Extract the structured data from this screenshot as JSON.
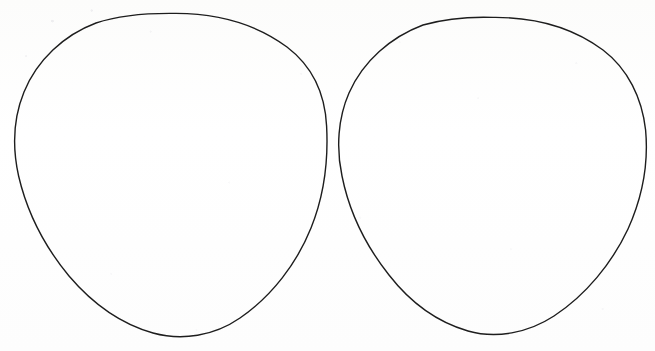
{
  "canvas": {
    "width": 655,
    "height": 351,
    "background_color": "#fdfdfc",
    "paper_tone": "#ffffff",
    "description": "Scanned sheet of paper with two hand-drawn circle outlines side by side"
  },
  "ink": {
    "stroke_color": "#1d1d1d",
    "stroke_width": 1.4,
    "style": "hand-drawn pen outline"
  },
  "shapes": [
    {
      "id": "left-circle",
      "label": "Left circle",
      "type": "circle-outline",
      "center_x": 170,
      "center_y": 175,
      "radius_x": 156,
      "radius_y": 162,
      "bounds": {
        "left": 14,
        "top": 13,
        "right": 327,
        "bottom": 338
      },
      "filled": false,
      "path": "M 176 13.4 C 217 13.6 256 24 287 47 C 312 66 325 94 326.6 126 C 328.4 160 324 196 311 228 C 297 263 272 296 240 318 C 214 336 182 341 153 333 C 121 324 92 303 69 276 C 45 247 27 212 18.6 176 C 12.4 148 13.4 118 24 92 C 37 60 64 35 96 23 C 121 14.6 149 13 176 13.4 Z"
    },
    {
      "id": "right-circle",
      "label": "Right circle",
      "type": "circle-outline",
      "center_x": 494,
      "center_y": 177,
      "radius_x": 153,
      "radius_y": 160,
      "bounds": {
        "left": 340,
        "top": 17,
        "right": 647,
        "bottom": 338
      },
      "filled": false,
      "path": "M 493 17.4 C 533 17 572 27 603 50 C 628 69 642 98 645.6 130 C 648.6 163 642 198 628 229 C 612 263 586 295 554 316 C 528 333 496 339 468 331 C 437 322 410 302 389 275 C 366 246 349 211 342 176 C 336 148 338 118 349 93 C 363 61 391 37 423 25 C 445 18.8 469 16.6 493 17.4 Z"
    }
  ],
  "annotations": {
    "count": 2,
    "gap_between_circles_px": 13,
    "text_content": "none"
  }
}
